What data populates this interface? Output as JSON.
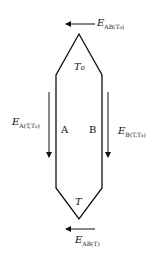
{
  "diagram": {
    "labels": {
      "top_arrow": {
        "main": "E",
        "sub": "AB(T₀)"
      },
      "bottom_arrow": {
        "main": "E",
        "sub": "AB(T)"
      },
      "left_arrow": {
        "main": "E",
        "sub": "A(T,T₀)"
      },
      "right_arrow": {
        "main": "E",
        "sub": "B(T,T₀)"
      },
      "top_junction": "T₀",
      "bottom_junction": "T",
      "left_branch": "A",
      "right_branch": "B"
    }
  }
}
